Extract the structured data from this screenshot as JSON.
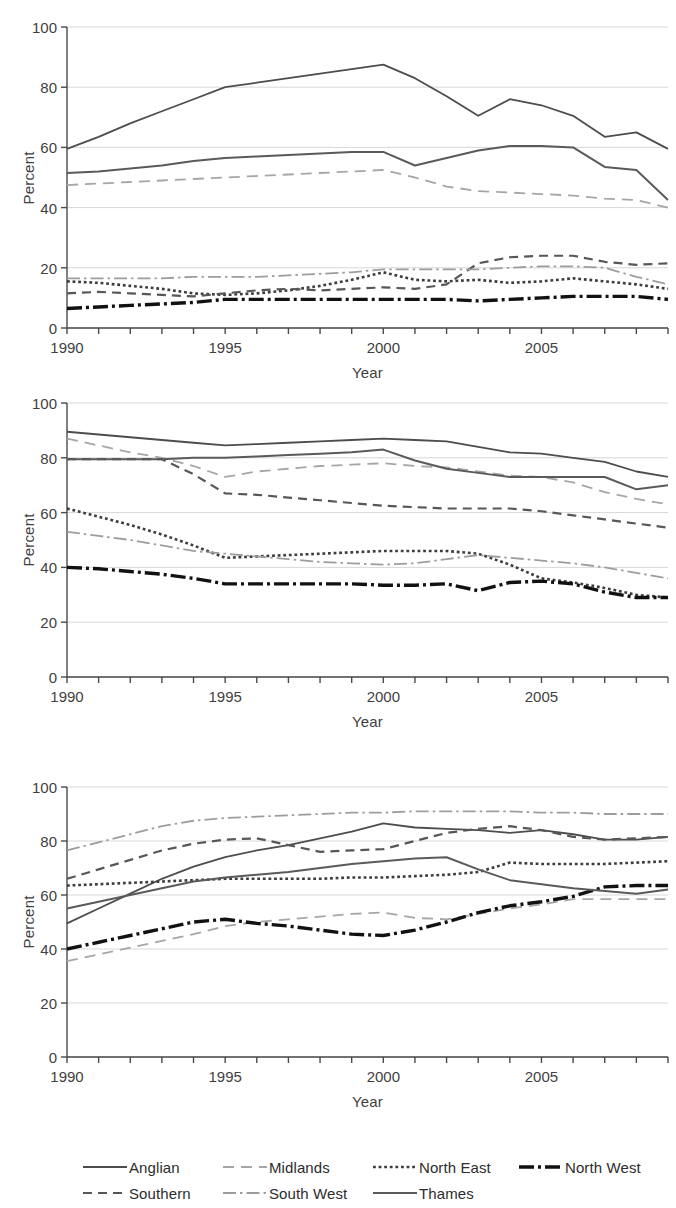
{
  "axes": {
    "ylabel": "Percent",
    "xlabel": "Year",
    "yticks": [
      "0",
      "20",
      "40",
      "60",
      "80",
      "100"
    ],
    "xticks": [
      "1990",
      "1995",
      "2000",
      "2005"
    ],
    "ymin": 0,
    "ymax": 100,
    "xmin": 1990,
    "xmax": 2009
  },
  "legend": {
    "items": [
      {
        "label": "Anglian",
        "style": "solid",
        "color": "#4d4d4d",
        "width": 1.8
      },
      {
        "label": "Midlands",
        "style": "dash-long",
        "color": "#a6a6a6",
        "width": 1.8
      },
      {
        "label": "North East",
        "style": "dot-square",
        "color": "#3d3d3d",
        "width": 2.6
      },
      {
        "label": "North West",
        "style": "dash-dot-b",
        "color": "#111111",
        "width": 3.4
      },
      {
        "label": "Southern",
        "style": "dash-med",
        "color": "#575757",
        "width": 2.2
      },
      {
        "label": "South West",
        "style": "dash-dot",
        "color": "#9d9d9d",
        "width": 1.8
      },
      {
        "label": "Thames",
        "style": "solid",
        "color": "#5a5a5a",
        "width": 2.0
      }
    ]
  },
  "chart_data": [
    {
      "type": "line",
      "title": "",
      "xlabel": "Year",
      "ylabel": "Percent",
      "xlim": [
        1990,
        2009
      ],
      "ylim": [
        0,
        100
      ],
      "grid": "horizontal",
      "x": [
        1990,
        1991,
        1992,
        1993,
        1994,
        1995,
        1996,
        1997,
        1998,
        1999,
        2000,
        2001,
        2002,
        2003,
        2004,
        2005,
        2006,
        2007,
        2008,
        2009
      ],
      "series": [
        {
          "name": "Anglian",
          "values": [
            59.5,
            63.5,
            68.0,
            72.0,
            76.0,
            80.0,
            81.5,
            83.0,
            84.5,
            86.0,
            87.5,
            83.0,
            77.0,
            70.5,
            76.0,
            74.0,
            70.5,
            63.5,
            65.0,
            59.5
          ]
        },
        {
          "name": "Midlands",
          "values": [
            47.5,
            48.0,
            48.5,
            49.0,
            49.5,
            50.0,
            50.5,
            51.0,
            51.5,
            52.0,
            52.5,
            50.0,
            47.0,
            45.5,
            45.0,
            44.5,
            44.0,
            43.0,
            42.5,
            40.0
          ]
        },
        {
          "name": "North East",
          "values": [
            15.5,
            15.0,
            14.0,
            13.0,
            11.5,
            11.0,
            11.5,
            12.5,
            14.0,
            16.0,
            18.5,
            16.0,
            15.5,
            16.0,
            15.0,
            15.5,
            16.5,
            15.5,
            14.5,
            13.0
          ]
        },
        {
          "name": "North West",
          "values": [
            6.5,
            7.0,
            7.5,
            8.0,
            8.5,
            9.5,
            9.5,
            9.5,
            9.5,
            9.5,
            9.5,
            9.5,
            9.5,
            9.0,
            9.5,
            10.0,
            10.5,
            10.5,
            10.5,
            9.5
          ]
        },
        {
          "name": "Southern",
          "values": [
            11.5,
            12.0,
            11.5,
            11.0,
            10.5,
            11.5,
            12.5,
            13.0,
            12.5,
            13.0,
            13.5,
            13.0,
            14.5,
            21.5,
            23.5,
            24.0,
            24.0,
            22.0,
            21.0,
            21.5
          ]
        },
        {
          "name": "South West",
          "values": [
            16.5,
            16.5,
            16.5,
            16.5,
            17.0,
            17.0,
            17.0,
            17.5,
            18.0,
            18.5,
            19.5,
            19.5,
            19.5,
            19.5,
            20.0,
            20.5,
            20.5,
            20.0,
            17.0,
            14.5
          ]
        },
        {
          "name": "Thames",
          "values": [
            51.5,
            52.0,
            53.0,
            54.0,
            55.5,
            56.5,
            57.0,
            57.5,
            58.0,
            58.5,
            58.5,
            54.0,
            56.5,
            59.0,
            60.5,
            60.5,
            60.0,
            53.5,
            52.5,
            42.5
          ]
        }
      ]
    },
    {
      "type": "line",
      "title": "",
      "xlabel": "Year",
      "ylabel": "Percent",
      "xlim": [
        1990,
        2009
      ],
      "ylim": [
        0,
        100
      ],
      "grid": "horizontal",
      "x": [
        1990,
        1991,
        1992,
        1993,
        1994,
        1995,
        1996,
        1997,
        1998,
        1999,
        2000,
        2001,
        2002,
        2003,
        2004,
        2005,
        2006,
        2007,
        2008,
        2009
      ],
      "series": [
        {
          "name": "Anglian",
          "values": [
            89.5,
            88.5,
            87.5,
            86.5,
            85.5,
            84.5,
            85.0,
            85.5,
            86.0,
            86.5,
            87.0,
            86.5,
            86.0,
            84.0,
            82.0,
            81.5,
            80.0,
            78.5,
            75.0,
            73.0
          ]
        },
        {
          "name": "Midlands",
          "values": [
            87.0,
            84.5,
            82.0,
            80.0,
            77.0,
            73.0,
            75.0,
            76.0,
            77.0,
            77.5,
            78.0,
            77.0,
            76.5,
            75.0,
            73.5,
            73.0,
            71.0,
            67.5,
            65.0,
            63.0
          ]
        },
        {
          "name": "North East",
          "values": [
            61.5,
            58.5,
            55.5,
            52.0,
            48.0,
            43.5,
            44.0,
            44.5,
            45.0,
            45.5,
            46.0,
            46.0,
            46.0,
            45.0,
            41.0,
            36.0,
            34.5,
            32.5,
            30.0,
            29.0
          ]
        },
        {
          "name": "North West",
          "values": [
            40.0,
            39.5,
            38.5,
            37.5,
            36.0,
            34.0,
            34.0,
            34.0,
            34.0,
            34.0,
            33.5,
            33.5,
            34.0,
            31.5,
            34.5,
            35.0,
            34.0,
            31.0,
            29.0,
            29.0
          ]
        },
        {
          "name": "Southern",
          "values": [
            79.5,
            79.5,
            79.5,
            79.5,
            74.0,
            67.0,
            66.5,
            65.5,
            64.5,
            63.5,
            62.5,
            62.0,
            61.5,
            61.5,
            61.5,
            60.5,
            59.0,
            57.5,
            56.0,
            54.5
          ]
        },
        {
          "name": "South West",
          "values": [
            53.0,
            51.5,
            50.0,
            48.0,
            46.0,
            45.0,
            44.0,
            43.0,
            42.0,
            41.5,
            41.0,
            41.5,
            43.0,
            44.5,
            43.5,
            42.5,
            41.5,
            40.0,
            38.0,
            36.0
          ]
        },
        {
          "name": "Thames",
          "values": [
            79.5,
            79.5,
            79.5,
            79.5,
            80.0,
            80.0,
            80.5,
            81.0,
            81.5,
            82.0,
            83.0,
            79.0,
            76.0,
            74.5,
            73.0,
            73.0,
            73.0,
            73.0,
            68.5,
            70.0
          ]
        }
      ]
    },
    {
      "type": "line",
      "title": "",
      "xlabel": "Year",
      "ylabel": "Percent",
      "xlim": [
        1990,
        2009
      ],
      "ylim": [
        0,
        100
      ],
      "grid": "horizontal",
      "x": [
        1990,
        1991,
        1992,
        1993,
        1994,
        1995,
        1996,
        1997,
        1998,
        1999,
        2000,
        2001,
        2002,
        2003,
        2004,
        2005,
        2006,
        2007,
        2008,
        2009
      ],
      "series": [
        {
          "name": "Anglian",
          "values": [
            49.5,
            55.0,
            60.5,
            66.0,
            70.5,
            74.0,
            76.5,
            78.5,
            81.0,
            83.5,
            86.5,
            85.0,
            84.5,
            84.0,
            83.0,
            84.0,
            82.5,
            80.5,
            80.5,
            81.5
          ]
        },
        {
          "name": "Midlands",
          "values": [
            35.5,
            38.0,
            40.5,
            43.0,
            45.5,
            48.5,
            50.0,
            51.0,
            52.0,
            53.0,
            53.5,
            51.5,
            51.0,
            53.0,
            55.0,
            56.5,
            58.5,
            58.5,
            58.5,
            58.5
          ]
        },
        {
          "name": "North East",
          "values": [
            63.5,
            64.0,
            64.5,
            65.0,
            65.5,
            66.0,
            66.0,
            66.0,
            66.0,
            66.5,
            66.5,
            67.0,
            67.5,
            68.5,
            72.0,
            71.5,
            71.5,
            71.5,
            72.0,
            72.5
          ]
        },
        {
          "name": "North West",
          "values": [
            40.0,
            42.5,
            45.0,
            47.5,
            50.0,
            51.0,
            49.5,
            48.5,
            47.0,
            45.5,
            45.0,
            47.0,
            50.0,
            53.5,
            56.0,
            57.5,
            59.5,
            63.0,
            63.5,
            63.5
          ]
        },
        {
          "name": "Southern",
          "values": [
            66.0,
            69.5,
            73.0,
            76.5,
            79.0,
            80.5,
            81.0,
            78.5,
            76.0,
            76.5,
            77.0,
            80.0,
            83.0,
            84.5,
            85.5,
            84.0,
            81.5,
            80.5,
            81.0,
            81.5
          ]
        },
        {
          "name": "South West",
          "values": [
            76.5,
            79.5,
            82.5,
            85.5,
            87.5,
            88.5,
            89.0,
            89.5,
            90.0,
            90.5,
            90.5,
            91.0,
            91.0,
            91.0,
            91.0,
            90.5,
            90.5,
            90.0,
            90.0,
            90.0
          ]
        },
        {
          "name": "Thames",
          "values": [
            55.0,
            57.5,
            60.0,
            62.5,
            65.0,
            66.5,
            67.5,
            68.5,
            70.0,
            71.5,
            72.5,
            73.5,
            74.0,
            69.5,
            65.5,
            64.0,
            62.5,
            61.5,
            60.5,
            62.0
          ]
        }
      ]
    }
  ]
}
